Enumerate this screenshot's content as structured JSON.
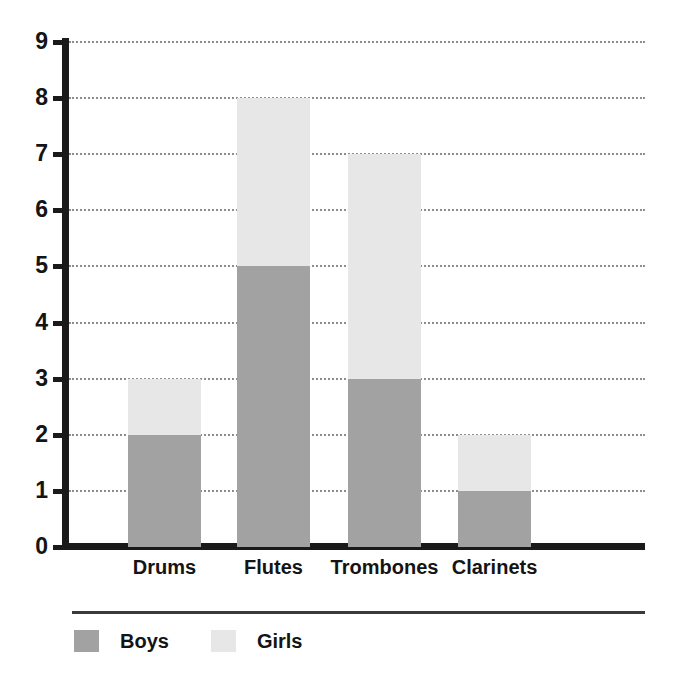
{
  "chart_data": {
    "type": "bar",
    "subtype": "stacked-vertical-bar",
    "title": "",
    "subtitle": "",
    "xlabel": "",
    "ylabel": "",
    "categories": [
      "Drums",
      "Flutes",
      "Trombones",
      "Clarinets"
    ],
    "series": [
      {
        "name": "Boys",
        "color": "#a2a2a2",
        "values": [
          2,
          5,
          3,
          1
        ]
      },
      {
        "name": "Girls",
        "color": "#e7e7e7",
        "values": [
          1,
          3,
          4,
          1
        ]
      }
    ],
    "totals": [
      3,
      8,
      7,
      2
    ],
    "ylim": [
      0,
      9
    ],
    "y_ticks": [
      0,
      1,
      2,
      3,
      4,
      5,
      6,
      7,
      8,
      9
    ],
    "y_tick_labels": [
      "0",
      "1",
      "2",
      "3",
      "4",
      "5",
      "6",
      "7",
      "8",
      "9"
    ],
    "y_tick_step": 1,
    "grid": {
      "horizontal": true,
      "vertical": false,
      "style": "dotted",
      "color": "#8d8d8d"
    },
    "legend": {
      "position": "bottom-left",
      "entries": [
        "Boys",
        "Girls"
      ]
    },
    "annotations": [],
    "axis_color": "#1a1a1a",
    "background": "#ffffff"
  },
  "axes": {
    "y_tick_labels": [
      "9",
      "8",
      "7",
      "6",
      "5",
      "4",
      "3",
      "2",
      "1",
      "0"
    ],
    "x_tick_labels": [
      "Drums",
      "Flutes",
      "Trombones",
      "Clarinets"
    ]
  },
  "legend": {
    "entries": [
      {
        "label": "Boys",
        "color": "#a2a2a2"
      },
      {
        "label": "Girls",
        "color": "#e7e7e7"
      }
    ]
  }
}
